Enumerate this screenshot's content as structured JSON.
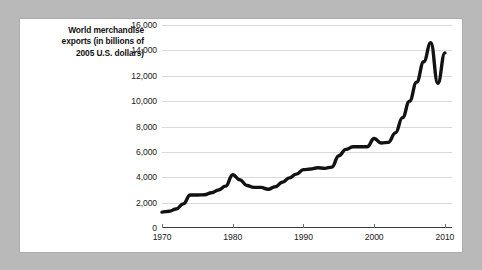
{
  "figure": {
    "caption_lines": [
      "World merchandise",
      "exports (in billions of",
      "2005 U.S. dollars)"
    ],
    "caption_full": "World merchandise exports (in billions of 2005 U.S. dollars)",
    "card_background": "#ffffff",
    "page_background": "#b9b9b9"
  },
  "chart_data": {
    "type": "line",
    "title": "",
    "subtitle": "",
    "xlabel": "",
    "ylabel": "World merchandise exports (in billions of 2005 U.S. dollars)",
    "xlim": [
      1970,
      2011
    ],
    "ylim": [
      0,
      16000
    ],
    "grid": true,
    "grid_axis": "y",
    "legend": false,
    "legend_position": "none",
    "line_color": "#121212",
    "grid_color": "#d9d9d9",
    "axis_color": "#3c3c3c",
    "y_ticks": [
      0,
      2000,
      4000,
      6000,
      8000,
      10000,
      12000,
      14000,
      16000
    ],
    "y_tick_labels": [
      "0",
      "2,000",
      "4,000",
      "6,000",
      "8,000",
      "10,000",
      "12,000",
      "14,000",
      "16,000"
    ],
    "x_ticks": [
      1970,
      1980,
      1990,
      2000,
      2010
    ],
    "x_tick_labels": [
      "1970",
      "1980",
      "1990",
      "2000",
      "2010"
    ],
    "series": [
      {
        "name": "World merchandise exports",
        "x": [
          1970,
          1971,
          1972,
          1973,
          1974,
          1975,
          1976,
          1977,
          1978,
          1979,
          1980,
          1981,
          1982,
          1983,
          1984,
          1985,
          1986,
          1987,
          1988,
          1989,
          1990,
          1991,
          1992,
          1993,
          1994,
          1995,
          1996,
          1997,
          1998,
          1999,
          2000,
          2001,
          2002,
          2003,
          2004,
          2005,
          2006,
          2007,
          2008,
          2009,
          2010
        ],
        "values": [
          1250,
          1320,
          1500,
          1900,
          2600,
          2600,
          2620,
          2780,
          3000,
          3300,
          4200,
          3800,
          3350,
          3200,
          3200,
          3050,
          3250,
          3600,
          3950,
          4250,
          4600,
          4650,
          4750,
          4700,
          4800,
          5700,
          6200,
          6400,
          6400,
          6400,
          7050,
          6700,
          6750,
          7500,
          8700,
          10000,
          11500,
          13100,
          14600,
          11400,
          13800
        ]
      }
    ]
  }
}
